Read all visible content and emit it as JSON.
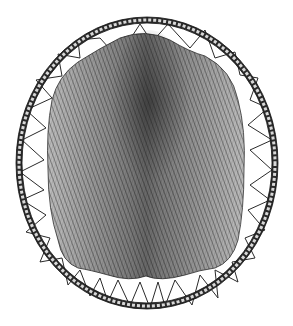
{
  "image": {
    "subject": "beaver pelt stretched on a round wooden hoop",
    "style": "black and white pen-and-ink engraving",
    "background_color": "#ffffff",
    "ink_color": "#1a1a1a",
    "fur_mid_color": "#6e6e6e",
    "fur_dark_color": "#2e2e2e",
    "hoop": {
      "cx": 147,
      "cy": 163,
      "rx": 128,
      "ry": 143
    },
    "pelt": {
      "cx": 146,
      "cy": 158,
      "rx": 104,
      "ry": 122
    }
  }
}
